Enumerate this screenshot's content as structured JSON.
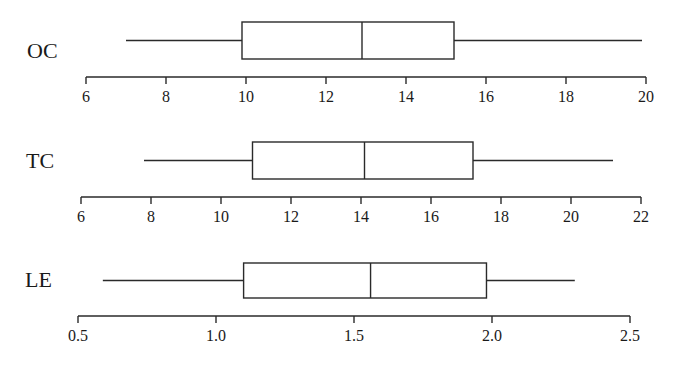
{
  "chart_data": [
    {
      "type": "boxplot",
      "label": "OC",
      "axis": {
        "min": 6,
        "max": 20,
        "ticks": [
          6,
          8,
          10,
          12,
          14,
          16,
          18,
          20
        ],
        "tick_labels": [
          "6",
          "8",
          "10",
          "12",
          "14",
          "16",
          "18",
          "20"
        ]
      },
      "stats": {
        "min": 7.0,
        "q1": 9.9,
        "median": 12.9,
        "q3": 15.2,
        "max": 19.9
      },
      "orientation": "horizontal",
      "grid": false
    },
    {
      "type": "boxplot",
      "label": "TC",
      "axis": {
        "min": 6,
        "max": 22,
        "ticks": [
          6,
          8,
          10,
          12,
          14,
          16,
          18,
          20,
          22
        ],
        "tick_labels": [
          "6",
          "8",
          "10",
          "12",
          "14",
          "16",
          "18",
          "20",
          "22"
        ]
      },
      "stats": {
        "min": 7.8,
        "q1": 10.9,
        "median": 14.1,
        "q3": 17.2,
        "max": 21.2
      },
      "orientation": "horizontal",
      "grid": false
    },
    {
      "type": "boxplot",
      "label": "LE",
      "axis": {
        "min": 0.5,
        "max": 2.5,
        "ticks": [
          0.5,
          1.0,
          1.5,
          2.0,
          2.5
        ],
        "tick_labels": [
          "0.5",
          "1.0",
          "1.5",
          "2.0",
          "2.5"
        ]
      },
      "stats": {
        "min": 0.59,
        "q1": 1.1,
        "median": 1.56,
        "q3": 1.98,
        "max": 2.3
      },
      "orientation": "horizontal",
      "grid": false
    }
  ],
  "layout": [
    {
      "axis_x0": 86,
      "axis_x1": 646,
      "axis_y": 77,
      "box_top": 22,
      "box_bottom": 59,
      "label_x": 27,
      "label_y": 58
    },
    {
      "axis_x0": 81,
      "axis_x1": 641,
      "axis_y": 197,
      "box_top": 142,
      "box_bottom": 179,
      "label_x": 26,
      "label_y": 168
    },
    {
      "axis_x0": 78,
      "axis_x1": 630,
      "axis_y": 316,
      "box_top": 263,
      "box_bottom": 298,
      "label_x": 25,
      "label_y": 287
    }
  ],
  "colors": {
    "stroke": "#2a2a2a",
    "text": "#1a1a1a",
    "background": "#ffffff"
  }
}
